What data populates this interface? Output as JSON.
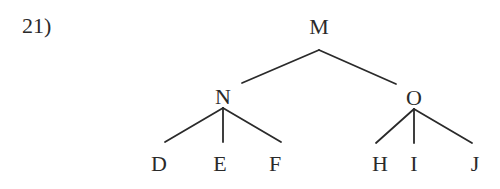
{
  "question_number": "21)",
  "tree": {
    "root": "M",
    "nodes": {
      "M": {
        "label": "M",
        "x": 319,
        "y": 15
      },
      "N": {
        "label": "N",
        "x": 223,
        "y": 85
      },
      "O": {
        "label": "O",
        "x": 414,
        "y": 86
      },
      "D": {
        "label": "D",
        "x": 159,
        "y": 152
      },
      "E": {
        "label": "E",
        "x": 220,
        "y": 152
      },
      "F": {
        "label": "F",
        "x": 275,
        "y": 152
      },
      "H": {
        "label": "H",
        "x": 380,
        "y": 152
      },
      "I": {
        "label": "I",
        "x": 414,
        "y": 152
      },
      "J": {
        "label": "J",
        "x": 475,
        "y": 152
      }
    },
    "edges": [
      {
        "from": "M",
        "to": "N",
        "x1": 319,
        "y1": 50,
        "x2": 242,
        "y2": 83
      },
      {
        "from": "M",
        "to": "O",
        "x1": 319,
        "y1": 50,
        "x2": 396,
        "y2": 84
      },
      {
        "from": "N",
        "to": "D",
        "x1": 223,
        "y1": 108,
        "x2": 165,
        "y2": 142
      },
      {
        "from": "N",
        "to": "E",
        "x1": 223,
        "y1": 108,
        "x2": 223,
        "y2": 142
      },
      {
        "from": "N",
        "to": "F",
        "x1": 223,
        "y1": 108,
        "x2": 281,
        "y2": 142
      },
      {
        "from": "O",
        "to": "H",
        "x1": 414,
        "y1": 109,
        "x2": 376,
        "y2": 143
      },
      {
        "from": "O",
        "to": "I",
        "x1": 414,
        "y1": 109,
        "x2": 414,
        "y2": 143
      },
      {
        "from": "O",
        "to": "J",
        "x1": 414,
        "y1": 109,
        "x2": 472,
        "y2": 143
      }
    ],
    "children": {
      "M": [
        "N",
        "O"
      ],
      "N": [
        "D",
        "E",
        "F"
      ],
      "O": [
        "H",
        "I",
        "J"
      ]
    }
  }
}
